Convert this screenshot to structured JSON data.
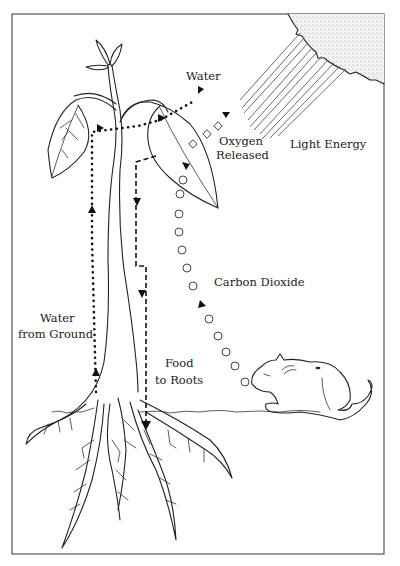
{
  "diagram": {
    "labels": {
      "water": "Water",
      "oxygen_line1": "Oxygen",
      "oxygen_line2": "Released",
      "light_energy": "Light Energy",
      "carbon_dioxide": "Carbon Dioxide",
      "water_ground_line1": "Water",
      "water_ground_line2": "from Ground",
      "food_line1": "Food",
      "food_line2": "to Roots"
    },
    "elements": {
      "sun": "sun-icon",
      "plant": "plant-illustration",
      "mouse": "mouse-illustration",
      "roots": "roots-illustration",
      "ground": "ground-line"
    },
    "flows": [
      {
        "name": "water-from-ground",
        "style": "dotted",
        "direction": "up"
      },
      {
        "name": "water-out",
        "style": "dotted",
        "direction": "up-right"
      },
      {
        "name": "oxygen-released",
        "style": "diamonds",
        "direction": "out"
      },
      {
        "name": "light-energy",
        "style": "rays",
        "direction": "toward-leaf"
      },
      {
        "name": "carbon-dioxide",
        "style": "circles",
        "direction": "mouse-to-leaf"
      },
      {
        "name": "food-to-roots",
        "style": "dashed",
        "direction": "down"
      }
    ],
    "colors": {
      "ink": "#222222",
      "background": "#ffffff",
      "border": "#555555"
    }
  }
}
